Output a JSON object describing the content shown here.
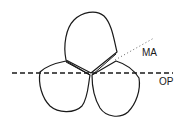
{
  "diagram": {
    "colors": {
      "stroke": "#1a1a1a",
      "background": "#ffffff",
      "dotted": "#666666"
    },
    "lines": [
      {
        "id": "op",
        "label": "OP",
        "style": "dashed"
      },
      {
        "id": "ma",
        "label": "MA",
        "style": "dotted"
      }
    ],
    "shapes": [
      {
        "id": "lobe-top",
        "description": "upper lobe"
      },
      {
        "id": "lobe-lower-left",
        "description": "lower-left lobe"
      },
      {
        "id": "lobe-lower-right",
        "description": "lower-right lobe"
      }
    ]
  }
}
